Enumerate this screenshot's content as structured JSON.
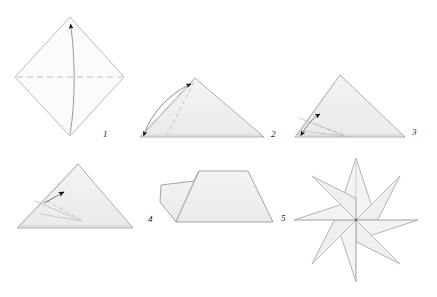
{
  "figure": {
    "type": "origami-instruction-diagram",
    "panel_count": 6,
    "background_color": "#ffffff",
    "paper_fill": "#f0f0f0",
    "paper_stroke": "#9a9a9a",
    "crease_stroke": "#b8b8b8",
    "dashed_stroke": "#bdbdbd",
    "arrow_color": "#111111",
    "label_color": "#1a1a1a"
  },
  "steps": [
    {
      "number": "1",
      "label": "1",
      "shape": "square-diamond",
      "description": "Square rotated 45 degrees with horizontal dashed valley fold across the middle; curved arrow folds the bottom vertex up to the top vertex.",
      "label_x": 103,
      "label_y": 137,
      "annotations": [
        "dashed-horizontal-fold-line",
        "curved-fold-arrow-up"
      ]
    },
    {
      "number": "2",
      "label": "2",
      "shape": "triangle",
      "description": "Folded triangle; double headed curved arrow along the left slanted edge with dashed diagonal crease from the apex.",
      "label_x": 271,
      "label_y": 137,
      "annotations": [
        "dashed-diagonal-crease",
        "double-headed-curved-arrow"
      ]
    },
    {
      "number": "3",
      "label": "3",
      "shape": "triangle",
      "description": "Triangle with inner flap creases converging near the base centre; small double headed arrow at the lower left and dashed crease line.",
      "label_x": 412,
      "label_y": 135,
      "annotations": [
        "inner-flap-creases",
        "dashed-crease",
        "double-headed-arrow"
      ]
    },
    {
      "number": "4",
      "label": "4",
      "shape": "triangle",
      "description": "Flatter triangle with fan creases radiating from the base centre; short arrow indicating the next fold.",
      "label_x": 148,
      "label_y": 222,
      "annotations": [
        "fan-creases",
        "short-fold-arrow"
      ]
    },
    {
      "number": "5",
      "label": "5",
      "shape": "polygon-flap",
      "description": "Resulting narrow module: a small flap on the left joined to a larger wedge on the right.",
      "label_x": 281,
      "label_y": 221,
      "annotations": [
        "module-crease-line"
      ]
    },
    {
      "number": "6",
      "label": "",
      "shape": "eight-point-star",
      "description": "Finished assembly: eight kite shaped modules joined at a common centre forming an eight pointed star rosette.",
      "label_x": 0,
      "label_y": 0,
      "petal_count": 8,
      "annotations": [
        "radial-creases"
      ]
    }
  ]
}
